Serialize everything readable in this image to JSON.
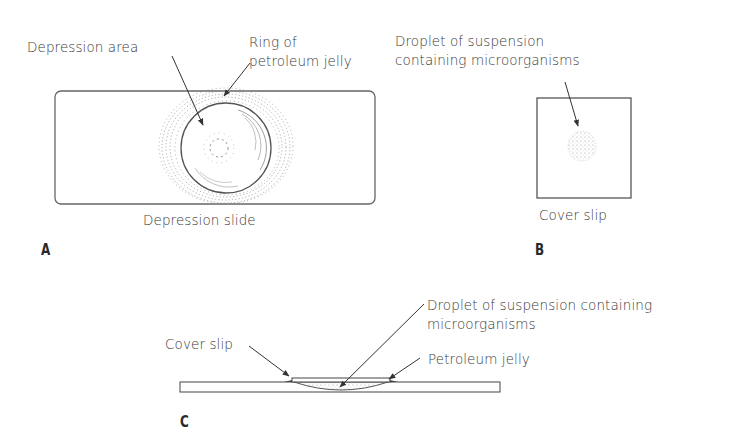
{
  "panels": {
    "A": {
      "letter": "A",
      "caption": "Depression slide",
      "labels": {
        "depression_area": "Depression area",
        "ring_line1": "Ring of",
        "ring_line2": "petroleum jelly"
      }
    },
    "B": {
      "letter": "B",
      "caption": "Cover slip",
      "labels": {
        "droplet_line1": "Droplet of suspension",
        "droplet_line2": "containing microorganisms"
      }
    },
    "C": {
      "letter": "C",
      "labels": {
        "cover_slip": "Cover slip",
        "droplet_line1": "Droplet of suspension containing",
        "droplet_line2": "microorganisms",
        "petroleum_jelly": "Petroleum jelly"
      }
    }
  },
  "colors": {
    "line": "#555555",
    "stipple": "#8a8a8a",
    "text": "#3a3a3a"
  }
}
